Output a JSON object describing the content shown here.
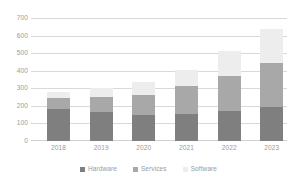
{
  "chart_data": {
    "type": "bar",
    "stacked": true,
    "title": "",
    "subtitle": "",
    "xlabel": "",
    "ylabel": "",
    "categories": [
      "2018",
      "2019",
      "2020",
      "2021",
      "2022",
      "2023"
    ],
    "series": [
      {
        "name": "Hardware",
        "color": "#7f7f7f",
        "values": [
          180,
          165,
          148,
          152,
          172,
          195
        ]
      },
      {
        "name": "Services",
        "color": "#a8a8a8",
        "values": [
          62,
          85,
          114,
          160,
          196,
          250
        ]
      },
      {
        "name": "Software",
        "color": "#ededed",
        "values": [
          36,
          50,
          76,
          93,
          144,
          195
        ]
      }
    ],
    "totals": [
      278,
      300,
      338,
      405,
      512,
      640
    ],
    "ylim": [
      0,
      700
    ],
    "yticks": [
      0,
      100,
      200,
      300,
      400,
      500,
      600,
      700
    ],
    "ytick_labels": [
      "0",
      "100",
      "200",
      "300",
      "400",
      "500",
      "600",
      "700"
    ],
    "grid": true,
    "legend_position": "bottom"
  },
  "axes": {
    "y_ticks": [
      "700",
      "600",
      "500",
      "400",
      "300",
      "200",
      "100",
      "0"
    ],
    "x_ticks": [
      "2018",
      "2019",
      "2020",
      "2021",
      "2022",
      "2023"
    ]
  },
  "legend": {
    "items": [
      {
        "label": "Hardware",
        "color": "#7f7f7f"
      },
      {
        "label": "Services",
        "color": "#a8a8a8"
      },
      {
        "label": "Software",
        "color": "#ededed"
      }
    ]
  },
  "colors": {
    "gridline": "#d9d9d9",
    "tick_text": "#9a9a9a",
    "background": "#ffffff"
  }
}
